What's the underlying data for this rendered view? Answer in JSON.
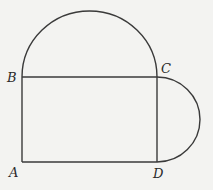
{
  "diagram": {
    "colors": {
      "background": "#f3f3f1",
      "stroke": "#3a3a3a",
      "label": "#2a2a2a"
    },
    "points": {
      "A": {
        "label": "A",
        "x": 22,
        "y": 162
      },
      "B": {
        "label": "B",
        "x": 22,
        "y": 77
      },
      "C": {
        "label": "C",
        "x": 157,
        "y": 77
      },
      "D": {
        "label": "D",
        "x": 157,
        "y": 162
      }
    },
    "shapes": [
      {
        "type": "rectangle",
        "vertices": [
          "A",
          "B",
          "C",
          "D"
        ]
      },
      {
        "type": "semicircle",
        "diameter": [
          "B",
          "C"
        ],
        "side": "top"
      },
      {
        "type": "semicircle",
        "diameter": [
          "C",
          "D"
        ],
        "side": "right"
      }
    ]
  }
}
